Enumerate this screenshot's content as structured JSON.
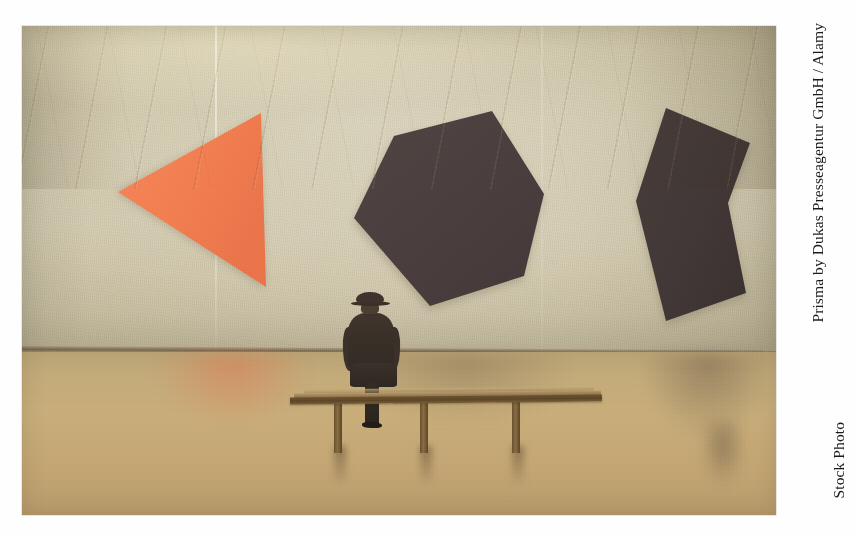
{
  "image": {
    "type": "photograph",
    "subject": "Man in hat seated on a gallery bench viewing three large abstract shaped canvases on a beige museum wall",
    "frame": {
      "left": 22,
      "top": 26,
      "width": 754,
      "height": 489
    }
  },
  "scene": {
    "wall": {
      "label": "gallery-wall",
      "color": "#d2caae"
    },
    "floor": {
      "label": "wood-parquet-floor",
      "color": "#c3ab7b"
    },
    "baseboard": {
      "label": "wall-floor-junction",
      "color": "#54402a"
    }
  },
  "artworks": [
    {
      "name": "orange-wedge",
      "shape": "triangular wedge pointing left",
      "color": "#f08050",
      "position": "left"
    },
    {
      "name": "dark-hexagon",
      "shape": "irregular hexagon",
      "color": "#4a3f3e",
      "position": "center"
    },
    {
      "name": "dark-chevron",
      "shape": "vertical chevron / zigzag slab",
      "color": "#433937",
      "position": "right"
    }
  ],
  "figures": {
    "seated_man": {
      "name": "seated-visitor",
      "description": "man wearing a hat and dark overcoat, seen from behind",
      "coat_color": "#3a3028",
      "hat_color": "#3f342c"
    },
    "bench": {
      "name": "gallery-bench",
      "color": "#6d532f",
      "legs": 3
    }
  },
  "credit": {
    "line1": "Prisma by Dukas Presseagentur GmbH / Alamy",
    "line2": "Stock Photo",
    "color": "#1a1a1a"
  }
}
